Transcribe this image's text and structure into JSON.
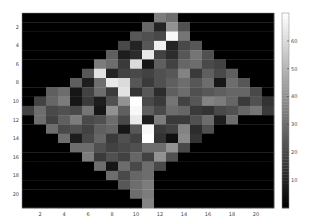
{
  "chart_data": {
    "type": "heatmap",
    "title": "",
    "xlabel": "",
    "ylabel": "",
    "colormap": "gray",
    "clim": [
      0,
      70
    ],
    "x_ticks": [
      "2",
      "4",
      "6",
      "8",
      "10",
      "12",
      "14",
      "16",
      "18",
      "20"
    ],
    "y_ticks": [
      "2",
      "4",
      "6",
      "8",
      "10",
      "12",
      "14",
      "16",
      "18",
      "20"
    ],
    "colorbar_ticks": [
      "10",
      "20",
      "30",
      "40",
      "50",
      "60"
    ],
    "colorbar_tick_values": [
      10,
      20,
      30,
      40,
      50,
      60
    ],
    "rows": 21,
    "cols": 21,
    "values": [
      [
        0,
        0,
        0,
        0,
        0,
        0,
        0,
        0,
        0,
        0,
        0,
        34,
        30,
        0,
        0,
        0,
        0,
        0,
        0,
        0,
        0
      ],
      [
        0,
        0,
        0,
        0,
        0,
        0,
        0,
        0,
        0,
        0,
        28,
        10,
        40,
        22,
        0,
        0,
        0,
        0,
        0,
        0,
        0
      ],
      [
        0,
        0,
        0,
        0,
        0,
        0,
        0,
        0,
        0,
        24,
        22,
        20,
        68,
        32,
        0,
        0,
        0,
        0,
        0,
        0,
        0
      ],
      [
        0,
        0,
        0,
        0,
        0,
        0,
        0,
        0,
        20,
        10,
        24,
        66,
        10,
        20,
        24,
        0,
        0,
        0,
        0,
        0,
        0
      ],
      [
        0,
        0,
        0,
        0,
        0,
        0,
        0,
        26,
        8,
        12,
        64,
        18,
        12,
        24,
        32,
        22,
        0,
        0,
        0,
        0,
        0
      ],
      [
        0,
        0,
        0,
        0,
        0,
        0,
        34,
        30,
        16,
        60,
        6,
        26,
        18,
        28,
        30,
        20,
        18,
        0,
        0,
        0,
        0
      ],
      [
        0,
        0,
        0,
        0,
        0,
        24,
        62,
        10,
        18,
        20,
        18,
        22,
        24,
        36,
        16,
        26,
        20,
        26,
        0,
        0,
        0
      ],
      [
        0,
        0,
        0,
        0,
        26,
        8,
        30,
        64,
        60,
        24,
        16,
        22,
        26,
        30,
        24,
        30,
        6,
        30,
        24,
        0,
        0
      ],
      [
        0,
        0,
        26,
        30,
        6,
        18,
        30,
        16,
        62,
        14,
        24,
        12,
        26,
        30,
        22,
        24,
        26,
        28,
        28,
        20,
        0
      ],
      [
        0,
        18,
        28,
        34,
        6,
        16,
        8,
        22,
        40,
        70,
        20,
        16,
        32,
        18,
        24,
        36,
        34,
        28,
        16,
        22,
        14
      ],
      [
        18,
        30,
        20,
        22,
        20,
        32,
        6,
        40,
        26,
        68,
        26,
        20,
        30,
        28,
        16,
        14,
        20,
        22,
        28,
        32,
        16
      ],
      [
        0,
        30,
        18,
        26,
        34,
        20,
        22,
        30,
        20,
        64,
        8,
        34,
        16,
        16,
        22,
        30,
        8,
        30,
        0,
        0,
        0
      ],
      [
        0,
        0,
        30,
        20,
        22,
        18,
        26,
        28,
        6,
        24,
        68,
        16,
        18,
        36,
        12,
        22,
        0,
        0,
        0,
        0,
        0
      ],
      [
        0,
        0,
        0,
        30,
        8,
        20,
        28,
        16,
        22,
        18,
        70,
        14,
        4,
        38,
        14,
        0,
        0,
        0,
        0,
        0,
        0
      ],
      [
        0,
        0,
        0,
        0,
        30,
        30,
        22,
        18,
        20,
        22,
        30,
        30,
        40,
        20,
        0,
        0,
        0,
        0,
        0,
        0,
        0
      ],
      [
        0,
        0,
        0,
        0,
        0,
        34,
        16,
        22,
        18,
        28,
        18,
        40,
        22,
        0,
        0,
        0,
        0,
        0,
        0,
        0,
        0
      ],
      [
        0,
        0,
        0,
        0,
        0,
        0,
        30,
        6,
        30,
        20,
        30,
        20,
        0,
        0,
        0,
        0,
        0,
        0,
        0,
        0,
        0
      ],
      [
        0,
        0,
        0,
        0,
        0,
        0,
        0,
        30,
        20,
        28,
        30,
        0,
        0,
        0,
        0,
        0,
        0,
        0,
        0,
        0,
        0
      ],
      [
        0,
        0,
        0,
        0,
        0,
        0,
        0,
        0,
        24,
        30,
        34,
        0,
        0,
        0,
        0,
        0,
        0,
        0,
        0,
        0,
        0
      ],
      [
        0,
        0,
        0,
        0,
        0,
        0,
        0,
        0,
        0,
        30,
        34,
        0,
        0,
        0,
        0,
        0,
        0,
        0,
        0,
        0,
        0
      ],
      [
        0,
        0,
        0,
        0,
        0,
        0,
        0,
        0,
        0,
        0,
        36,
        0,
        0,
        0,
        0,
        0,
        0,
        0,
        0,
        0,
        0
      ]
    ]
  }
}
